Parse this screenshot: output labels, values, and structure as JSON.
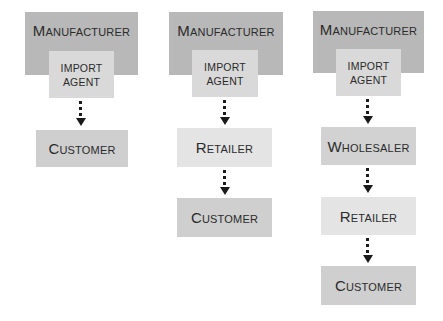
{
  "diagram": {
    "type": "distribution-channels",
    "colors": {
      "manufacturer": "#b8b8b8",
      "import_agent": "#d9d9d9",
      "retailer": "#e4e4e4",
      "wholesaler": "#d2d2d2",
      "customer": "#cfcfcf",
      "arrow": "#1a1a1a"
    },
    "channels": [
      {
        "manufacturer": "Manufacturer",
        "import_agent": [
          "IMPORT",
          "AGENT"
        ],
        "steps": [
          "Customer"
        ]
      },
      {
        "manufacturer": "Manufacturer",
        "import_agent": [
          "IMPORT",
          "AGENT"
        ],
        "steps": [
          "Retailer",
          "Customer"
        ]
      },
      {
        "manufacturer": "Manufacturer",
        "import_agent": [
          "IMPORT",
          "AGENT"
        ],
        "steps": [
          "Wholesaler",
          "Retailer",
          "Customer"
        ]
      }
    ]
  }
}
